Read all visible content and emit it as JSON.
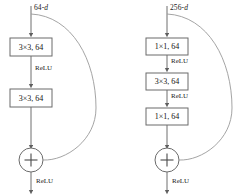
{
  "figure": {
    "type": "diagram",
    "blocks": [
      {
        "id": "basic-block",
        "input_label": "64-d",
        "layers": [
          {
            "label": "3×3, 64"
          },
          {
            "label": "3×3, 64"
          }
        ],
        "activations_between": [
          "ReLU"
        ],
        "sum_symbol": "+",
        "output_activation": "ReLU",
        "has_skip_connection": true
      },
      {
        "id": "bottleneck-block",
        "input_label": "256-d",
        "layers": [
          {
            "label": "1×1, 64"
          },
          {
            "label": "3×3, 64"
          },
          {
            "label": "1×1, 64"
          }
        ],
        "activations_between": [
          "ReLU",
          "ReLU"
        ],
        "sum_symbol": "+",
        "output_activation": "ReLU",
        "has_skip_connection": true
      }
    ],
    "colors": {
      "stroke": "#6f6f6f",
      "box_stroke": "#6b6b6b",
      "text": "#1a1a1a",
      "background": "#ffffff"
    }
  }
}
